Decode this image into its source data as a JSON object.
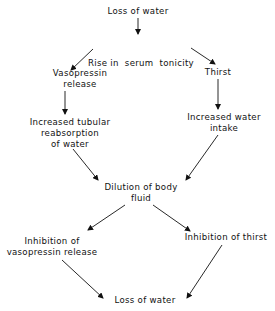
{
  "diagram": {
    "nodes": {
      "loss_top": {
        "lines": [
          "Loss of water"
        ]
      },
      "rise": {
        "lines": [
          "Rise in  serum  tonicity"
        ]
      },
      "vasopressin": {
        "lines": [
          "Vasopressin",
          "release"
        ]
      },
      "thirst": {
        "lines": [
          "Thirst"
        ]
      },
      "reabsorption": {
        "lines": [
          "Increased tubular",
          "reabsorption",
          "of water"
        ]
      },
      "intake": {
        "lines": [
          "Increased water",
          "intake"
        ]
      },
      "dilution": {
        "lines": [
          "Dilution of body",
          "fluid"
        ]
      },
      "inhib_vaso": {
        "lines": [
          "Inhibition of",
          "vasopressin release"
        ]
      },
      "inhib_thirst": {
        "lines": [
          "Inhibition of thirst"
        ]
      },
      "loss_bottom": {
        "lines": [
          "Loss of water"
        ]
      }
    },
    "edges": [
      {
        "from": "loss_top",
        "to": "rise"
      },
      {
        "from": "rise",
        "to": "vasopressin"
      },
      {
        "from": "rise",
        "to": "thirst"
      },
      {
        "from": "vasopressin",
        "to": "reabsorption"
      },
      {
        "from": "thirst",
        "to": "intake"
      },
      {
        "from": "reabsorption",
        "to": "dilution"
      },
      {
        "from": "intake",
        "to": "dilution"
      },
      {
        "from": "dilution",
        "to": "inhib_vaso"
      },
      {
        "from": "dilution",
        "to": "inhib_thirst"
      },
      {
        "from": "inhib_vaso",
        "to": "loss_bottom"
      },
      {
        "from": "inhib_thirst",
        "to": "loss_bottom"
      }
    ],
    "colors": {
      "background": "#ffffff",
      "ink": "#111111"
    }
  }
}
